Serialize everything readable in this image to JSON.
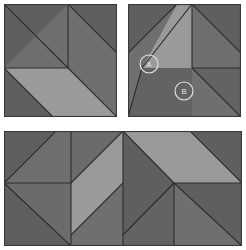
{
  "diagram": {
    "colors": {
      "dark_fabric": "#6b6b6b",
      "medium_fabric": "#636363",
      "light_fabric": "#9a9a9a",
      "seam_line": "#2c2c2c",
      "outline": "#3a3a3a",
      "background": "#ffffff",
      "label_stroke": "#e8e8e8"
    },
    "panels": [
      {
        "id": "panel-top-left",
        "name": "top-left-block",
        "x": 4,
        "y": 4,
        "width": 113,
        "height": 113
      },
      {
        "id": "panel-top-right",
        "name": "top-right-block",
        "x": 128,
        "y": 4,
        "width": 113,
        "height": 113
      },
      {
        "id": "panel-bottom",
        "name": "bottom-assembled-block",
        "x": 4,
        "y": 131,
        "width": 238,
        "height": 115
      }
    ],
    "labels": [
      {
        "id": "label-a",
        "name": "callout-a",
        "text": "A",
        "cx": 21,
        "cy": 60,
        "r": 9
      },
      {
        "id": "label-b",
        "name": "callout-b",
        "text": "B",
        "cx": 56,
        "cy": 87,
        "r": 9
      }
    ]
  }
}
